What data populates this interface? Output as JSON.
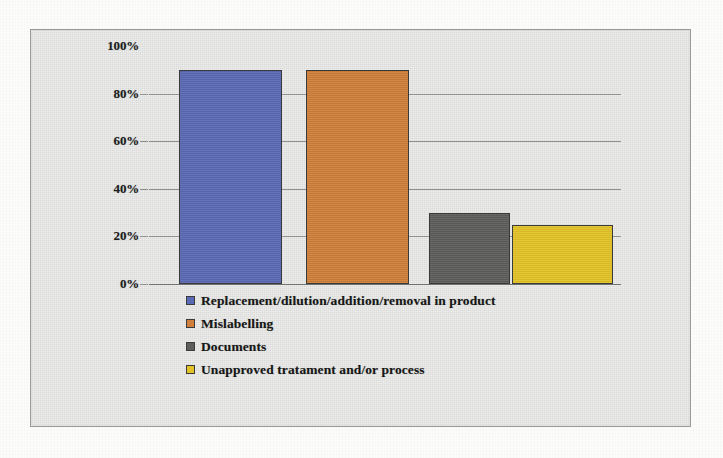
{
  "chart_data": {
    "type": "bar",
    "title": "",
    "xlabel": "",
    "ylabel": "",
    "ylim": [
      0,
      100
    ],
    "ytick_labels": [
      "100%",
      "80%",
      "60%",
      "40%",
      "20%",
      "0%"
    ],
    "ytick_values": [
      100,
      80,
      60,
      40,
      20,
      0
    ],
    "grid": true,
    "legend_position": "below-plot",
    "categories": [
      "Replacement/dilution/addition/removal in product",
      "Mislabelling",
      "Documents",
      "Unapproved tratament and/or process"
    ],
    "values": [
      90,
      90,
      30,
      25
    ],
    "value_unit": "%",
    "colors": [
      "#5b6ab4",
      "#d0803b",
      "#5e5e5d",
      "#e3c227"
    ],
    "series": [
      {
        "name": "Share of cases",
        "values": [
          90,
          90,
          30,
          25
        ]
      }
    ]
  },
  "legend": {
    "items": [
      {
        "label": "Replacement/dilution/addition/removal in product",
        "color": "#5b6ab4"
      },
      {
        "label": "Mislabelling",
        "color": "#d0803b"
      },
      {
        "label": "Documents",
        "color": "#5e5e5d"
      },
      {
        "label": "Unapproved tratament and/or process",
        "color": "#e3c227"
      }
    ]
  }
}
